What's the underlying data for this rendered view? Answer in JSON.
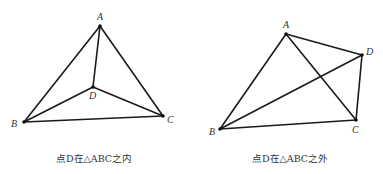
{
  "figures": [
    {
      "id": "inside",
      "caption": "点D在△ABC之内",
      "points": {
        "A": {
          "x": 100,
          "y": 26,
          "label": "A",
          "lx": 97,
          "ly": 20
        },
        "B": {
          "x": 24,
          "y": 122,
          "label": "B",
          "lx": 11,
          "ly": 127
        },
        "C": {
          "x": 163,
          "y": 116,
          "label": "C",
          "lx": 167,
          "ly": 123
        },
        "D": {
          "x": 93,
          "y": 87,
          "label": "D",
          "lx": 89,
          "ly": 99
        }
      },
      "edges": [
        [
          "A",
          "B"
        ],
        [
          "A",
          "C"
        ],
        [
          "B",
          "C"
        ],
        [
          "A",
          "D"
        ],
        [
          "B",
          "D"
        ],
        [
          "C",
          "D"
        ]
      ]
    },
    {
      "id": "outside",
      "caption": "点D在△ABC之外",
      "points": {
        "A": {
          "x": 286,
          "y": 34,
          "label": "A",
          "lx": 283,
          "ly": 28
        },
        "B": {
          "x": 220,
          "y": 129,
          "label": "B",
          "lx": 209,
          "ly": 135
        },
        "C": {
          "x": 356,
          "y": 120,
          "label": "C",
          "lx": 352,
          "ly": 133
        },
        "D": {
          "x": 362,
          "y": 55,
          "label": "D",
          "lx": 366,
          "ly": 55
        }
      },
      "edges": [
        [
          "A",
          "B"
        ],
        [
          "A",
          "C"
        ],
        [
          "B",
          "C"
        ],
        [
          "A",
          "D"
        ],
        [
          "B",
          "D"
        ],
        [
          "C",
          "D"
        ]
      ]
    }
  ],
  "colors": {
    "line": "#1a1a1a",
    "text": "#333333",
    "background": "#ffffff"
  }
}
